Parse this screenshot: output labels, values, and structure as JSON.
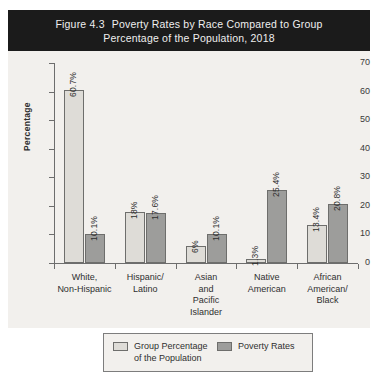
{
  "title": {
    "figure_number": "Figure 4.3",
    "line1": "Poverty Rates by Race Compared to Group",
    "line2": "Percentage of the Population, 2018"
  },
  "colors": {
    "banner_background": "#1b1b1b",
    "banner_text": "#efefef",
    "plot_background": "#f2f0ed",
    "series_0": "#dedcd7",
    "series_1": "#9d9d9b",
    "bar_outline": "#6e6e6c",
    "axis": "#6d6d6d",
    "text": "#2f2f2f"
  },
  "legend": {
    "entries": [
      {
        "label": "Group Percentage\nof the Population",
        "swatch": "series-0"
      },
      {
        "label": "Poverty Rates",
        "swatch": "series-1"
      }
    ]
  },
  "chart_data": {
    "type": "bar",
    "xlabel": "",
    "ylabel": "Percentage",
    "ylim": [
      0,
      70
    ],
    "yticks": [
      0,
      10,
      20,
      30,
      40,
      50,
      60,
      70
    ],
    "grid": false,
    "legend_position": "bottom",
    "categories": [
      "White,\nNon-Hispanic",
      "Hispanic/\nLatino",
      "Asian\nand\nPacific\nIslander",
      "Native\nAmerican",
      "African\nAmerican/\nBlack"
    ],
    "series": [
      {
        "name": "Group Percentage of the Population",
        "values": [
          60.7,
          18,
          6,
          1.3,
          13.4
        ],
        "labels": [
          "60.7%",
          "18%",
          "6%",
          "1.3%",
          "13.4%"
        ]
      },
      {
        "name": "Poverty Rates",
        "values": [
          10.1,
          17.6,
          10.1,
          25.4,
          20.8
        ],
        "labels": [
          "10.1%",
          "17.6%",
          "10.1%",
          "25.4%",
          "20.8%"
        ]
      }
    ]
  }
}
